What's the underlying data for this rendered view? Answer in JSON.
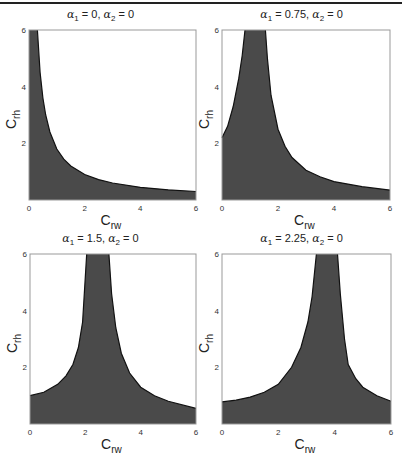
{
  "page": {
    "background": "#ffffff",
    "fill_color": "#4a4a4a",
    "boundary_color": "#111111",
    "axis_color": "#999999"
  },
  "chart_data": [
    {
      "type": "area",
      "title": "α1 = 0,  α2 = 0",
      "title_parts": {
        "a1_sym": "α",
        "a1_sub": "1",
        "a1_val": " = 0,  ",
        "a2_sym": "α",
        "a2_sub": "2",
        "a2_val": " = 0"
      },
      "xlabel": "C_rw",
      "xlabel_parts": {
        "base": "C",
        "sub": "rw"
      },
      "ylabel": "C_rh",
      "ylabel_parts": {
        "base": "C",
        "sub": "rh"
      },
      "xlim": [
        0,
        6
      ],
      "ylim": [
        0,
        6
      ],
      "xticks": [
        "0",
        "2",
        "4",
        "6"
      ],
      "yticks": [
        "2",
        "4",
        "6"
      ],
      "grid": false,
      "shaded_region_upper_boundary": {
        "x": [
          0,
          0.3,
          0.4,
          0.5,
          0.6,
          0.75,
          1.0,
          1.25,
          1.5,
          2.0,
          2.5,
          3.0,
          4.0,
          5.0,
          6.0
        ],
        "y": [
          6,
          6,
          4.5,
          3.6,
          3.0,
          2.4,
          1.8,
          1.44,
          1.2,
          0.9,
          0.72,
          0.6,
          0.45,
          0.36,
          0.3
        ]
      }
    },
    {
      "type": "area",
      "title": "α1 = 0.75,  α2 = 0",
      "title_parts": {
        "a1_sym": "α",
        "a1_sub": "1",
        "a1_val": " = 0.75,  ",
        "a2_sym": "α",
        "a2_sub": "2",
        "a2_val": " = 0"
      },
      "xlabel": "C_rw",
      "xlabel_parts": {
        "base": "C",
        "sub": "rw"
      },
      "ylabel": "C_rh",
      "ylabel_parts": {
        "base": "C",
        "sub": "rh"
      },
      "xlim": [
        0,
        6
      ],
      "ylim": [
        0,
        6
      ],
      "xticks": [
        "0",
        "2",
        "4",
        "6"
      ],
      "yticks": [
        "2",
        "4",
        "6"
      ],
      "grid": false,
      "shaded_region_upper_boundary": {
        "x": [
          0,
          0.2,
          0.4,
          0.6,
          0.72,
          0.82,
          1.55,
          1.62,
          1.75,
          2.0,
          2.25,
          2.5,
          3.0,
          3.5,
          4.0,
          5.0,
          6.0
        ],
        "y": [
          2.2,
          2.6,
          3.3,
          4.3,
          5.1,
          6,
          6,
          5.0,
          3.7,
          2.5,
          1.9,
          1.5,
          1.05,
          0.82,
          0.65,
          0.47,
          0.35
        ]
      }
    },
    {
      "type": "area",
      "title": "α1 = 1.5,  α2 = 0",
      "title_parts": {
        "a1_sym": "α",
        "a1_sub": "1",
        "a1_val": " = 1.5,  ",
        "a2_sym": "α",
        "a2_sub": "2",
        "a2_val": " = 0"
      },
      "xlabel": "C_rw",
      "xlabel_parts": {
        "base": "C",
        "sub": "rw"
      },
      "ylabel": "C_rh",
      "ylabel_parts": {
        "base": "C",
        "sub": "rh"
      },
      "xlim": [
        0,
        6
      ],
      "ylim": [
        0,
        6
      ],
      "xticks": [
        "0",
        "2",
        "4",
        "6"
      ],
      "yticks": [
        "2",
        "4",
        "6"
      ],
      "grid": false,
      "shaded_region_upper_boundary": {
        "x": [
          0,
          0.5,
          1.0,
          1.3,
          1.55,
          1.75,
          1.9,
          2.05,
          2.85,
          2.95,
          3.1,
          3.3,
          3.6,
          4.0,
          4.5,
          5.0,
          6.0
        ],
        "y": [
          1.0,
          1.12,
          1.4,
          1.7,
          2.1,
          2.7,
          3.6,
          6,
          6,
          4.6,
          3.4,
          2.5,
          1.8,
          1.3,
          1.0,
          0.8,
          0.55
        ]
      }
    },
    {
      "type": "area",
      "title": "α1 = 2.25,  α2 = 0",
      "title_parts": {
        "a1_sym": "α",
        "a1_sub": "1",
        "a1_val": " = 2.25,  ",
        "a2_sym": "α",
        "a2_sub": "2",
        "a2_val": " = 0"
      },
      "xlabel": "C_rw",
      "xlabel_parts": {
        "base": "C",
        "sub": "rw"
      },
      "ylabel": "C_rh",
      "ylabel_parts": {
        "base": "C",
        "sub": "rh"
      },
      "xlim": [
        0,
        6
      ],
      "ylim": [
        0,
        6
      ],
      "xticks": [
        "0",
        "2",
        "4",
        "6"
      ],
      "yticks": [
        "2",
        "4",
        "6"
      ],
      "grid": false,
      "shaded_region_upper_boundary": {
        "x": [
          0,
          0.5,
          1.0,
          1.5,
          2.0,
          2.47,
          2.8,
          3.05,
          3.2,
          3.35,
          4.1,
          4.2,
          4.35,
          4.48,
          4.75,
          5.0,
          5.5,
          6.0
        ],
        "y": [
          0.78,
          0.84,
          0.95,
          1.12,
          1.4,
          2.0,
          2.7,
          3.6,
          4.5,
          6,
          6,
          4.6,
          3.0,
          2.1,
          1.6,
          1.3,
          1.0,
          0.8
        ]
      }
    }
  ]
}
